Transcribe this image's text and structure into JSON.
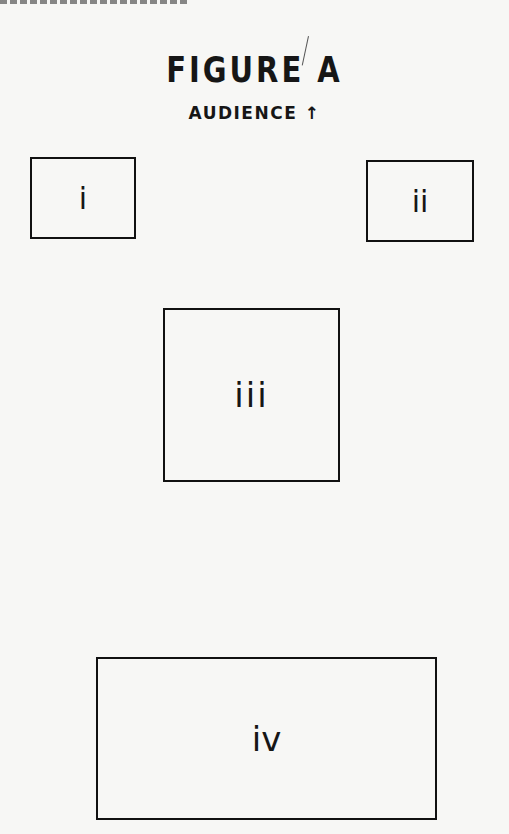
{
  "figure": {
    "title": "FIGURE A",
    "subtitle": "AUDIENCE",
    "subtitle_arrow": "↑"
  },
  "boxes": [
    {
      "id": "i",
      "label": "i"
    },
    {
      "id": "ii",
      "label": "ii"
    },
    {
      "id": "iii",
      "label": "iii"
    },
    {
      "id": "iv",
      "label": "iv"
    }
  ],
  "colors": {
    "ink": "#111111",
    "paper": "#f7f7f5"
  }
}
